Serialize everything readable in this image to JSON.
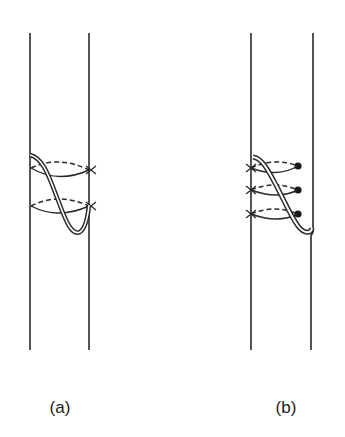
{
  "figure": {
    "panels": [
      {
        "id": "a",
        "label": "(a)",
        "description": "Band with ribbon twisting downward across two dashed/solid loops ending at crosses"
      },
      {
        "id": "b",
        "label": "(b)",
        "description": "Band with ribbon passing through three loops each with cross on left and dot on right, ribbon merging into right edge"
      }
    ]
  }
}
